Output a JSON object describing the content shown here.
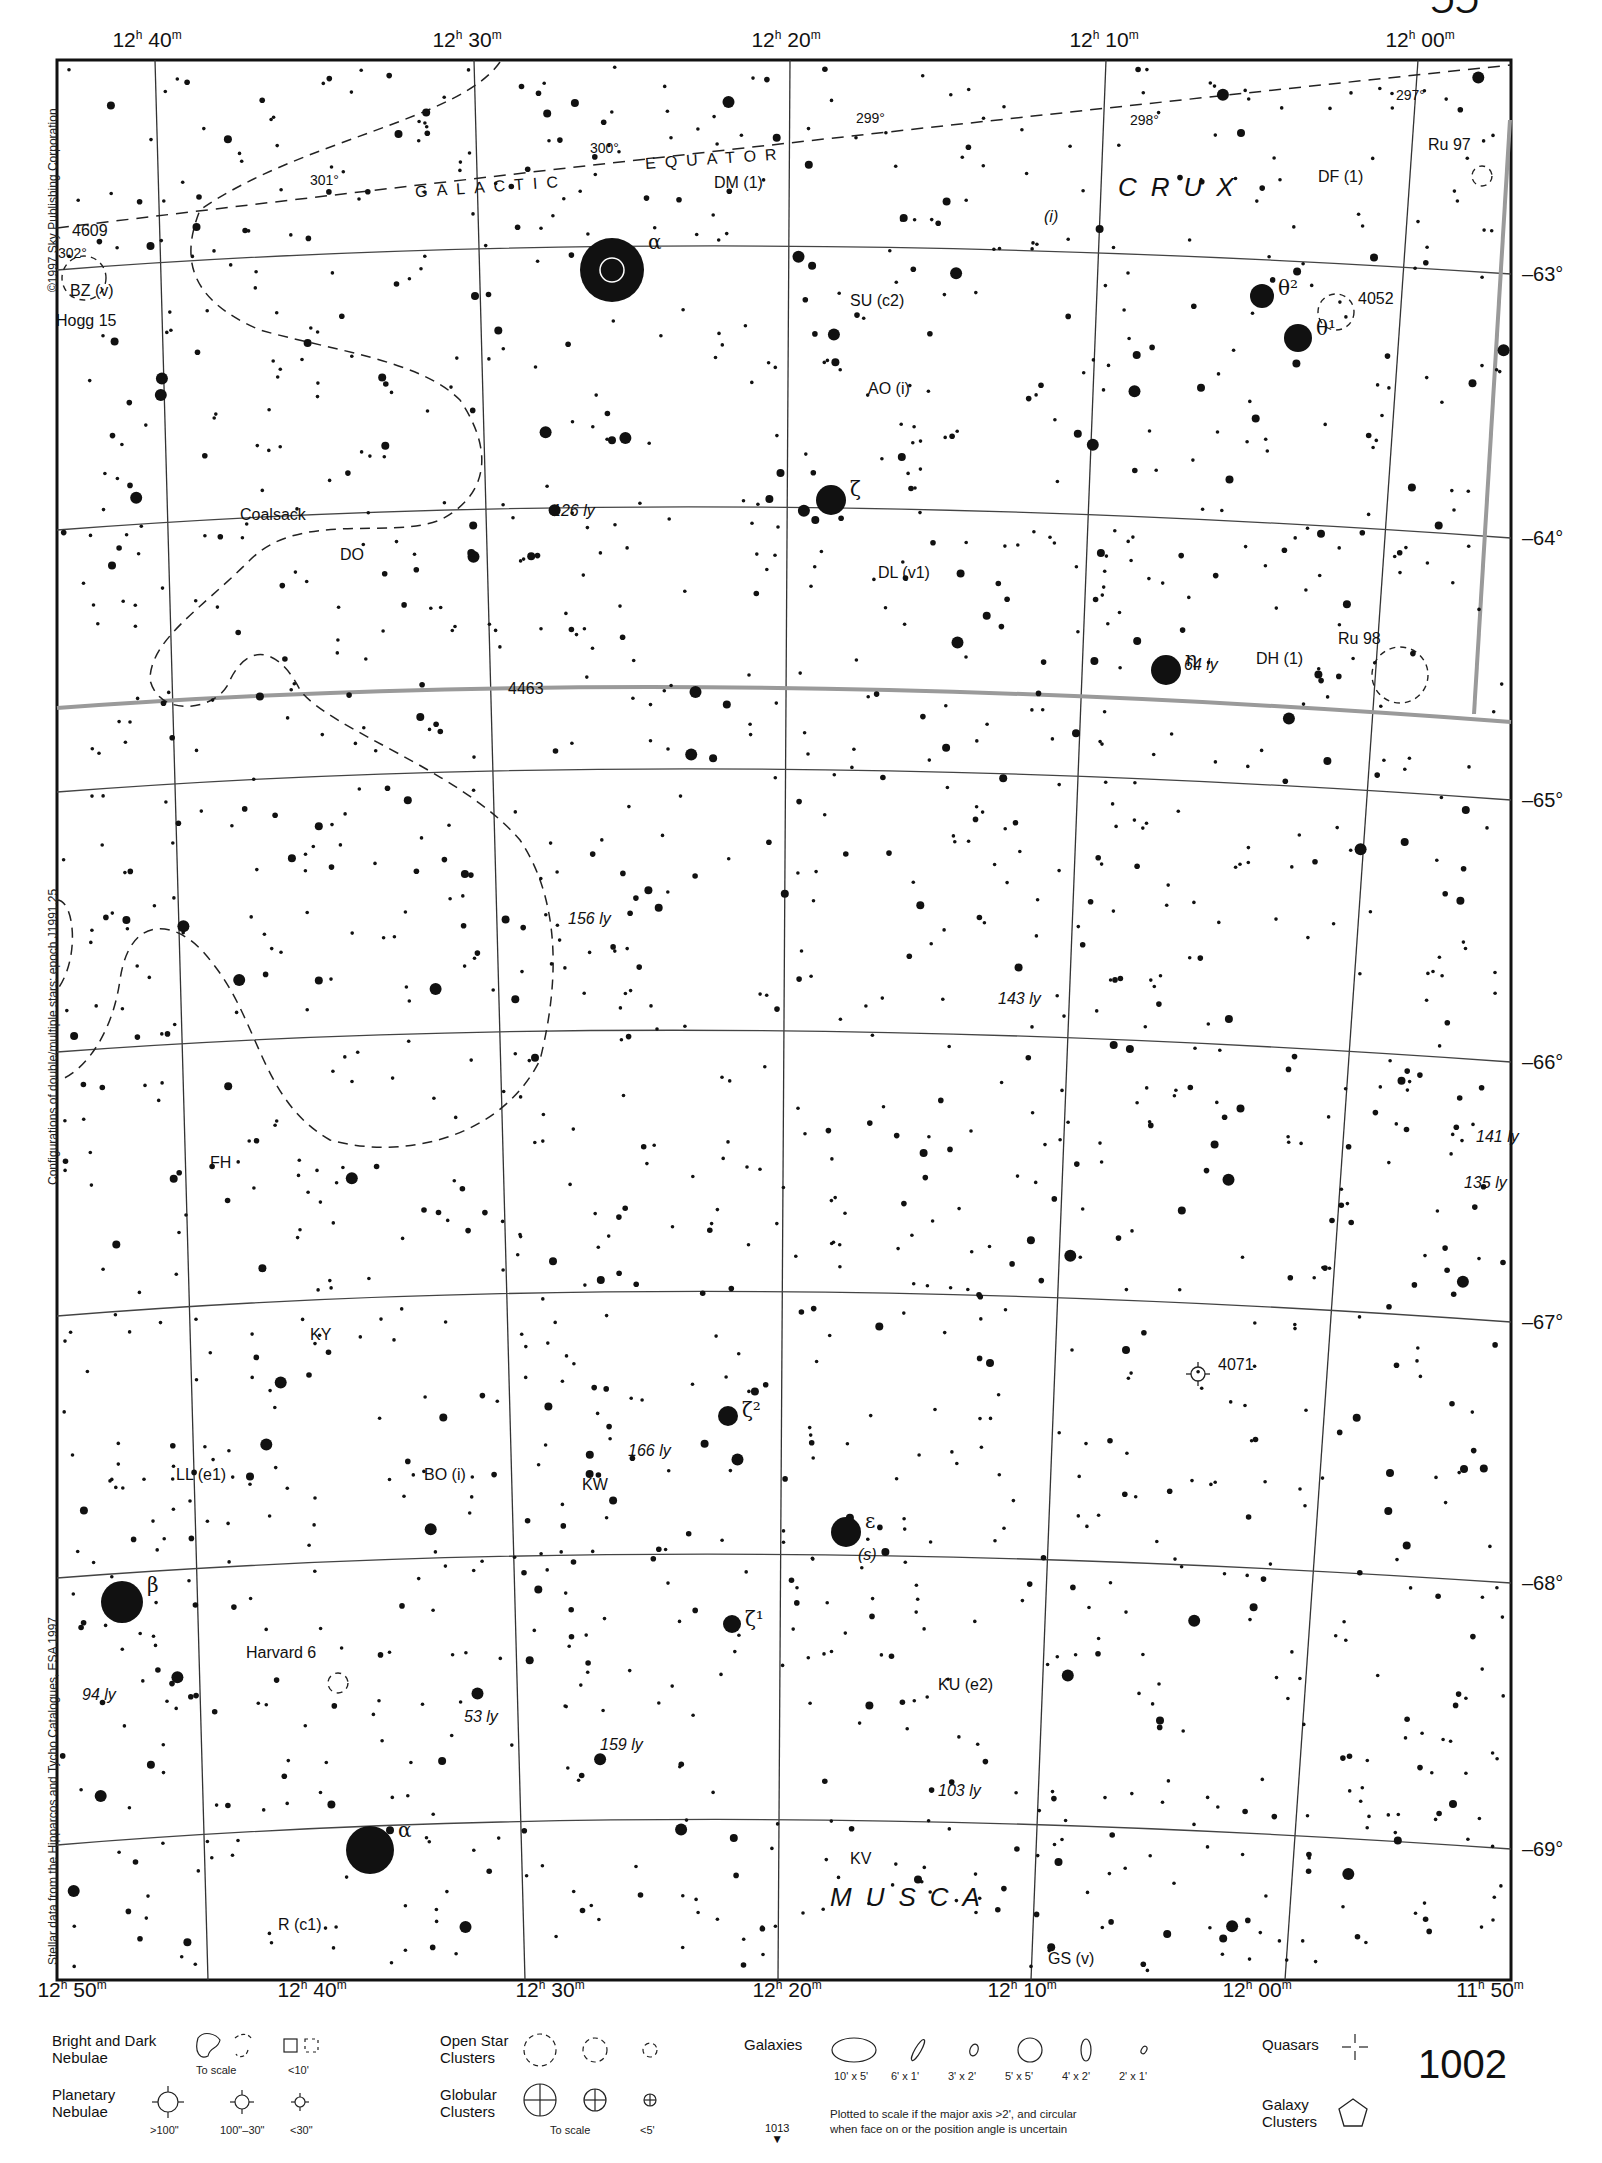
{
  "page": {
    "number": "1002",
    "next_page_ref": "1013",
    "next_page_arrow": "▼",
    "top_page_fragment": "ƆƆ"
  },
  "credits": {
    "copyright": "©1997 Sky Publishing Corporation",
    "epoch_note": "Configurations of double/multiple stars: epoch J1991.25",
    "data_source": "Stellar data from the Hipparcos and Tycho Catalogues, ESA 1997"
  },
  "axes": {
    "ra_top": [
      {
        "h": "12",
        "m": "40",
        "x": 147
      },
      {
        "h": "12",
        "m": "30",
        "x": 467
      },
      {
        "h": "12",
        "m": "20",
        "x": 786
      },
      {
        "h": "12",
        "m": "10",
        "x": 1104
      },
      {
        "h": "12",
        "m": "00",
        "x": 1420
      }
    ],
    "ra_bottom": [
      {
        "h": "12",
        "m": "50",
        "x": 72
      },
      {
        "h": "12",
        "m": "40",
        "x": 312
      },
      {
        "h": "12",
        "m": "30",
        "x": 550
      },
      {
        "h": "12",
        "m": "20",
        "x": 787
      },
      {
        "h": "12",
        "m": "10",
        "x": 1022
      },
      {
        "h": "12",
        "m": "00",
        "x": 1257
      },
      {
        "h": "11",
        "m": "50",
        "x": 1490
      }
    ],
    "dec_right": [
      {
        "label": "–63°",
        "y": 274
      },
      {
        "label": "–64°",
        "y": 538
      },
      {
        "label": "–65°",
        "y": 800
      },
      {
        "label": "–66°",
        "y": 1062
      },
      {
        "label": "–67°",
        "y": 1322
      },
      {
        "label": "–68°",
        "y": 1583
      },
      {
        "label": "–69°",
        "y": 1849
      }
    ]
  },
  "constellations": [
    {
      "name": "CRUX",
      "x": 1118,
      "y": 186
    },
    {
      "name": "MUSCA",
      "x": 830,
      "y": 1896
    }
  ],
  "galactic_equator": {
    "label_left": "GALACTIC",
    "label_right": "EQUATOR",
    "longitudes": [
      {
        "label": "302°",
        "x": 58,
        "y": 245
      },
      {
        "label": "301°",
        "x": 310,
        "y": 172
      },
      {
        "label": "300°",
        "x": 590,
        "y": 140
      },
      {
        "label": "299°",
        "x": 856,
        "y": 110
      },
      {
        "label": "298°",
        "x": 1130,
        "y": 112
      },
      {
        "label": "297°",
        "x": 1396,
        "y": 87
      }
    ]
  },
  "named_stars": [
    {
      "label": "Acrux",
      "greek": "α",
      "x": 612,
      "y": 270,
      "r": 32
    },
    {
      "label": "",
      "greek": "ζ",
      "x": 831,
      "y": 500,
      "r": 15
    },
    {
      "label": "",
      "greek": "θ²",
      "x": 1262,
      "y": 296,
      "r": 12
    },
    {
      "label": "",
      "greek": "θ¹",
      "x": 1298,
      "y": 338,
      "r": 14
    },
    {
      "label": "",
      "greek": "η",
      "x": 1166,
      "y": 670,
      "r": 15
    },
    {
      "label": "",
      "greek": "β",
      "x": 122,
      "y": 1602,
      "r": 21
    },
    {
      "label": "",
      "greek": "α",
      "x": 370,
      "y": 1850,
      "r": 24
    },
    {
      "label": "",
      "greek": "ε",
      "x": 846,
      "y": 1532,
      "r": 15
    },
    {
      "label": "",
      "greek": "ζ²",
      "x": 728,
      "y": 1416,
      "r": 10
    },
    {
      "label": "",
      "greek": "ζ¹",
      "x": 732,
      "y": 1624,
      "r": 9
    }
  ],
  "labels": [
    {
      "text": "4609",
      "x": 72,
      "y": 232,
      "italic": false
    },
    {
      "text": "BZ (v)",
      "x": 70,
      "y": 292,
      "italic": false
    },
    {
      "text": "Hogg 15",
      "x": 56,
      "y": 322,
      "italic": false
    },
    {
      "text": "DM (1)",
      "x": 714,
      "y": 184,
      "italic": false
    },
    {
      "text": "(i)",
      "x": 1044,
      "y": 218,
      "italic": true
    },
    {
      "text": "DF (1)",
      "x": 1318,
      "y": 178,
      "italic": false
    },
    {
      "text": "Ru 97",
      "x": 1428,
      "y": 146,
      "italic": false
    },
    {
      "text": "SU (c2)",
      "x": 850,
      "y": 302,
      "italic": false
    },
    {
      "text": "4052",
      "x": 1358,
      "y": 300,
      "italic": false
    },
    {
      "text": "AO (i)",
      "x": 868,
      "y": 390,
      "italic": false
    },
    {
      "text": "126 ly",
      "x": 552,
      "y": 512,
      "italic": true
    },
    {
      "text": "Coalsack",
      "x": 240,
      "y": 516,
      "italic": false
    },
    {
      "text": "DO",
      "x": 340,
      "y": 556,
      "italic": false
    },
    {
      "text": "DL (v1)",
      "x": 878,
      "y": 574,
      "italic": false
    },
    {
      "text": "64 ly",
      "x": 1184,
      "y": 666,
      "italic": true
    },
    {
      "text": "DH (1)",
      "x": 1256,
      "y": 660,
      "italic": false
    },
    {
      "text": "Ru 98",
      "x": 1338,
      "y": 640,
      "italic": false
    },
    {
      "text": "4463",
      "x": 508,
      "y": 690,
      "italic": false
    },
    {
      "text": "156 ly",
      "x": 568,
      "y": 920,
      "italic": true
    },
    {
      "text": "143 ly",
      "x": 998,
      "y": 1000,
      "italic": true
    },
    {
      "text": "FH",
      "x": 210,
      "y": 1164,
      "italic": false
    },
    {
      "text": "141 ly",
      "x": 1476,
      "y": 1138,
      "italic": true
    },
    {
      "text": "135 ly",
      "x": 1464,
      "y": 1184,
      "italic": true
    },
    {
      "text": "KY",
      "x": 310,
      "y": 1336,
      "italic": false
    },
    {
      "text": "4071",
      "x": 1218,
      "y": 1366,
      "italic": false
    },
    {
      "text": "166 ly",
      "x": 628,
      "y": 1452,
      "italic": true
    },
    {
      "text": "LL (e1)",
      "x": 176,
      "y": 1476,
      "italic": false
    },
    {
      "text": "BO (i)",
      "x": 424,
      "y": 1476,
      "italic": false
    },
    {
      "text": "KW",
      "x": 582,
      "y": 1486,
      "italic": false
    },
    {
      "text": "(s)",
      "x": 858,
      "y": 1556,
      "italic": true
    },
    {
      "text": "Harvard 6",
      "x": 246,
      "y": 1654,
      "italic": false
    },
    {
      "text": "94 ly",
      "x": 82,
      "y": 1696,
      "italic": true
    },
    {
      "text": "53 ly",
      "x": 464,
      "y": 1718,
      "italic": true
    },
    {
      "text": "159 ly",
      "x": 600,
      "y": 1746,
      "italic": true
    },
    {
      "text": "KU (e2)",
      "x": 938,
      "y": 1686,
      "italic": false
    },
    {
      "text": "103 ly",
      "x": 938,
      "y": 1792,
      "italic": true
    },
    {
      "text": "KV",
      "x": 850,
      "y": 1860,
      "italic": false
    },
    {
      "text": "R (c1)",
      "x": 278,
      "y": 1926,
      "italic": false
    },
    {
      "text": "GS (v)",
      "x": 1048,
      "y": 1960,
      "italic": false
    }
  ],
  "legend": {
    "nebulae": {
      "title_line1": "Bright and Dark",
      "title_line2": "Nebulae",
      "to_scale": "To scale",
      "small": "<10'"
    },
    "planetary": {
      "title_line1": "Planetary",
      "title_line2": "Nebulae",
      "sizes": [
        ">100\"",
        "100\"–30\"",
        "<30\""
      ]
    },
    "open_clusters": {
      "title_line1": "Open Star",
      "title_line2": "Clusters"
    },
    "globular": {
      "title_line1": "Globular",
      "title_line2": "Clusters",
      "to_scale": "To scale",
      "small": "<5'"
    },
    "galaxies": {
      "title": "Galaxies",
      "sizes": [
        "10' x 5'",
        "6' x 1'",
        "3' x 2'",
        "5' x 5'",
        "4' x 2'",
        "2' x 1'"
      ],
      "note_line1": "Plotted to scale if the major axis >2', and circular",
      "note_line2": "when face on or the position angle is uncertain"
    },
    "quasars": {
      "title": "Quasars"
    },
    "galaxy_clusters": {
      "title_line1": "Galaxy",
      "title_line2": "Clusters"
    }
  },
  "colors": {
    "ink": "#111111",
    "grid": "#444444",
    "paper": "#ffffff",
    "milky_way_band": "#9a9a9a"
  }
}
